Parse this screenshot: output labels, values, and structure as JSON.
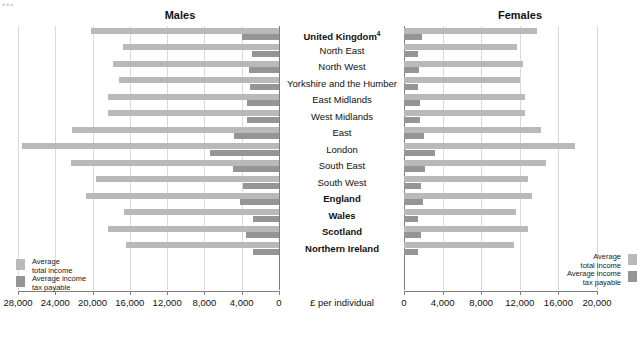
{
  "chart_data": {
    "type": "bar",
    "title": "",
    "orientation": "horizontal-diverging",
    "panels": [
      {
        "name": "Males",
        "axis": {
          "min": 0,
          "max": 28000,
          "ticks": [
            28000,
            24000,
            20000,
            16000,
            12000,
            8000,
            4000,
            0
          ],
          "tick_labels": [
            "28,000",
            "24,000",
            "20,000",
            "16,000",
            "12,000",
            "8,000",
            "4,000",
            "0"
          ],
          "direction": "right-to-left"
        }
      },
      {
        "name": "Females",
        "axis": {
          "min": 0,
          "max": 20000,
          "ticks": [
            0,
            4000,
            8000,
            12000,
            16000,
            20000
          ],
          "tick_labels": [
            "0",
            "4,000",
            "8,000",
            "12,000",
            "16,000",
            "20,000"
          ],
          "direction": "left-to-right"
        }
      }
    ],
    "xlabel": "£ per individual",
    "ylabel": "",
    "grid": true,
    "legend_position": "inside-bottom-both",
    "series": [
      {
        "name": "Average total income",
        "color": "#b9b9b9"
      },
      {
        "name": "Average income tax payable",
        "color": "#959595"
      }
    ],
    "categories": [
      "United Kingdom",
      "North East",
      "North West",
      "Yorkshire and the Humber",
      "East Midlands",
      "West Midlands",
      "East",
      "London",
      "South East",
      "South West",
      "England",
      "Wales",
      "Scotland",
      "Northern Ireland"
    ],
    "males": {
      "total_income": [
        20200,
        16700,
        17800,
        17200,
        18300,
        18300,
        22200,
        27600,
        22300,
        19600,
        20700,
        16600,
        18400,
        16400
      ],
      "income_tax": [
        4000,
        2900,
        3200,
        3100,
        3400,
        3400,
        4800,
        7400,
        4900,
        3900,
        4200,
        2800,
        3500,
        2800
      ]
    },
    "females": {
      "total_income": [
        13800,
        11700,
        12300,
        12000,
        12500,
        12500,
        14200,
        17700,
        14700,
        12900,
        13300,
        11600,
        12800,
        11400
      ],
      "income_tax": [
        1900,
        1400,
        1600,
        1500,
        1700,
        1700,
        2100,
        3200,
        2200,
        1800,
        2000,
        1400,
        1800,
        1400
      ]
    },
    "bold_categories": [
      "United Kingdom",
      "England",
      "Wales",
      "Scotland",
      "Northern Ireland"
    ],
    "footnote_markers": {
      "United Kingdom": "4"
    }
  },
  "panels": {
    "males_title": "Males",
    "females_title": "Females"
  },
  "axis": {
    "xlabel": "£ per individual",
    "males_ticks": [
      "28,000",
      "24,000",
      "20,000",
      "16,000",
      "12,000",
      "8,000",
      "4,000",
      "0"
    ],
    "females_ticks": [
      "0",
      "4,000",
      "8,000",
      "12,000",
      "16,000",
      "20,000"
    ]
  },
  "legend": {
    "total_income": "Average\ntotal income",
    "income_tax": "Average income\ntax payable"
  },
  "categories": [
    {
      "label": "United Kingdom",
      "sup": "4",
      "bold": true
    },
    {
      "label": "North East",
      "sup": "",
      "bold": false
    },
    {
      "label": "North West",
      "sup": "",
      "bold": false
    },
    {
      "label": "Yorkshire and the Humber",
      "sup": "",
      "bold": false
    },
    {
      "label": "East Midlands",
      "sup": "",
      "bold": false
    },
    {
      "label": "West Midlands",
      "sup": "",
      "bold": false
    },
    {
      "label": "East",
      "sup": "",
      "bold": false
    },
    {
      "label": "London",
      "sup": "",
      "bold": false
    },
    {
      "label": "South East",
      "sup": "",
      "bold": false
    },
    {
      "label": "South West",
      "sup": "",
      "bold": false
    },
    {
      "label": "England",
      "sup": "",
      "bold": true
    },
    {
      "label": "Wales",
      "sup": "",
      "bold": true
    },
    {
      "label": "Scotland",
      "sup": "",
      "bold": true
    },
    {
      "label": "Northern Ireland",
      "sup": "",
      "bold": true
    }
  ],
  "colors": {
    "total_income": "#b9b9b9",
    "income_tax": "#959595",
    "grid": "#d9d9d9",
    "axis": "#808080"
  }
}
